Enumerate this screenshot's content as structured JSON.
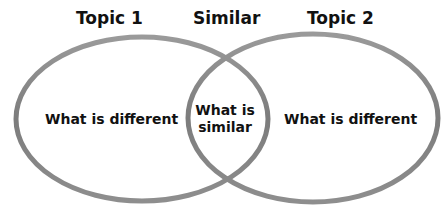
{
  "diagram": {
    "type": "venn",
    "headings": {
      "left": "Topic 1",
      "middle": "Similar",
      "right": "Topic 2"
    },
    "regions": {
      "left": "What is different",
      "overlap_line1": "What is",
      "overlap_line2": "similar",
      "right": "What is different"
    },
    "colors": {
      "ellipse_stroke": "#8a8a8a",
      "text": "#111111",
      "background": "#ffffff"
    }
  }
}
